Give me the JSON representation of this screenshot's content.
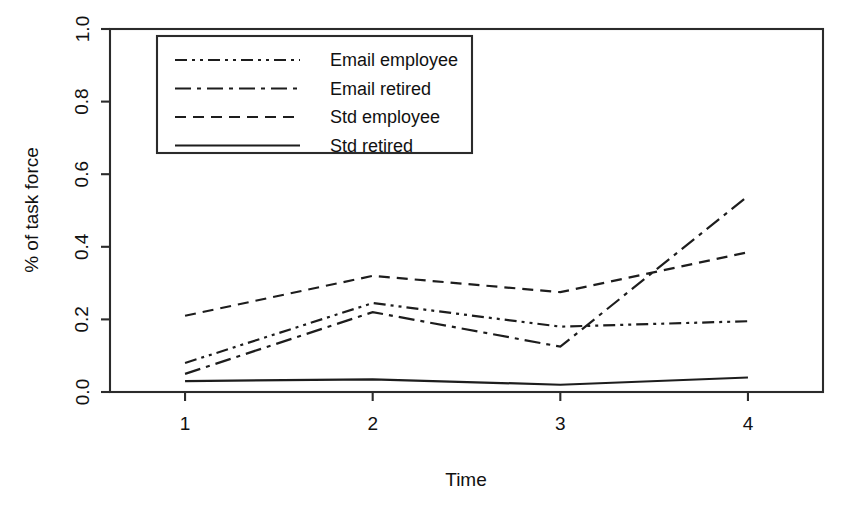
{
  "chart_data": {
    "type": "line",
    "title": "",
    "xlabel": "Time",
    "ylabel": "% of task force",
    "x": [
      1,
      2,
      3,
      4
    ],
    "xticklabels": [
      "1",
      "2",
      "3",
      "4"
    ],
    "yticklabels": [
      "0.0",
      "0.2",
      "0.4",
      "0.6",
      "0.8",
      "1.0"
    ],
    "yticks": [
      0.0,
      0.2,
      0.4,
      0.6,
      0.8,
      1.0
    ],
    "xlim": [
      0.6,
      4.4
    ],
    "ylim": [
      0.0,
      1.0
    ],
    "grid": false,
    "legend_position": "top-left-inside",
    "series": [
      {
        "name": "Email employee",
        "linestyle": "dashdotdot",
        "dasharray": "12 5 3 5 3 5",
        "values": [
          0.08,
          0.245,
          0.18,
          0.195
        ]
      },
      {
        "name": "Email retired",
        "linestyle": "dashdot",
        "dasharray": "16 6 4 6",
        "values": [
          0.05,
          0.22,
          0.125,
          0.54
        ]
      },
      {
        "name": "Std employee",
        "linestyle": "dashed",
        "dasharray": "11 7",
        "values": [
          0.21,
          0.32,
          0.275,
          0.385
        ]
      },
      {
        "name": "Std retired",
        "linestyle": "solid",
        "dasharray": "none",
        "values": [
          0.03,
          0.035,
          0.02,
          0.04
        ]
      }
    ],
    "colors": {
      "line": "#1d1d1d",
      "axis": "#2b2b2b",
      "background": "#ffffff",
      "text": "#111111"
    }
  }
}
